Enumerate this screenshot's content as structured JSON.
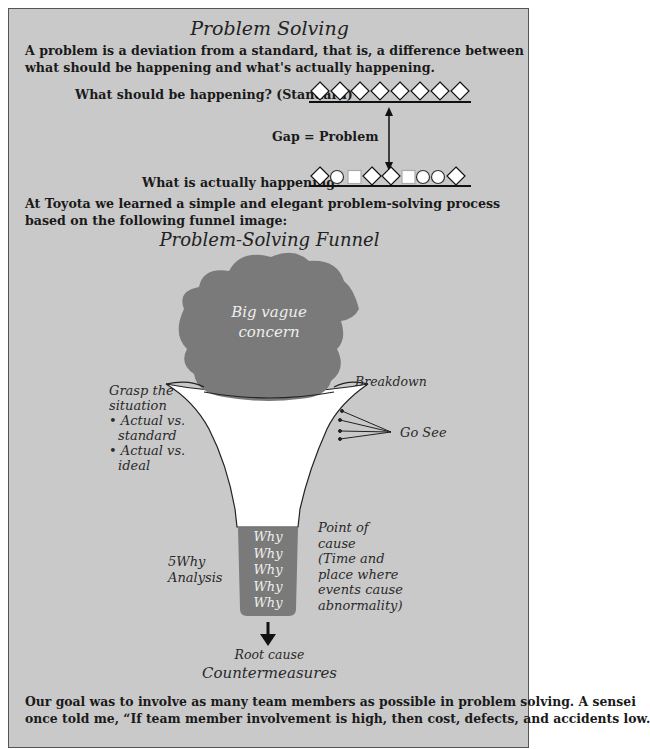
{
  "header": {
    "title": "Problem Solving",
    "definition": "A problem is a deviation from a standard, that is, a difference between what should be happening and what's actually happening."
  },
  "gap_diagram": {
    "standard_label": "What should be happening? (Standard)",
    "gap_label": "Gap = Problem",
    "actual_label": "What is actually happening?",
    "standard_shapes": [
      "diamond",
      "diamond",
      "diamond",
      "diamond",
      "diamond",
      "diamond",
      "diamond",
      "diamond"
    ],
    "actual_shapes": [
      "diamond",
      "circle",
      "square",
      "diamond",
      "diamond",
      "square",
      "circle",
      "circle",
      "diamond"
    ]
  },
  "intro": "At Toyota we learned a simple and elegant problem-solving process based on the following funnel image:",
  "funnel": {
    "title": "Problem-Solving Funnel",
    "cloud_label_line1": "Big vague",
    "cloud_label_line2": "concern",
    "breakdown_label": "Breakdown",
    "grasp": {
      "line1": "Grasp the",
      "line2": "situation",
      "bullets": [
        {
          "line1": "• Actual vs.",
          "line2": "standard"
        },
        {
          "line1": "• Actual vs.",
          "line2": "ideal"
        }
      ]
    },
    "go_see_label": "Go See",
    "five_why": {
      "line1": "5Why",
      "line2": "Analysis"
    },
    "whys": [
      "Why",
      "Why",
      "Why",
      "Why",
      "Why"
    ],
    "point_of_cause": [
      "Point of",
      "cause",
      "(Time and",
      "place where",
      "events cause",
      "abnormality)"
    ],
    "root_cause_label": "Root cause",
    "countermeasures_label": "Countermeasures",
    "colors": {
      "background": "#c9c9c9",
      "cloud": "#7a7a7a",
      "funnel": "#ffffff",
      "why_box": "#7a7a7a"
    }
  },
  "closing": {
    "line1": "Our goal was to involve as many team members as possible in problem solving. A sensei",
    "line2": "once told me, “If team member involvement is high, then cost, defects, and accidents low."
  }
}
